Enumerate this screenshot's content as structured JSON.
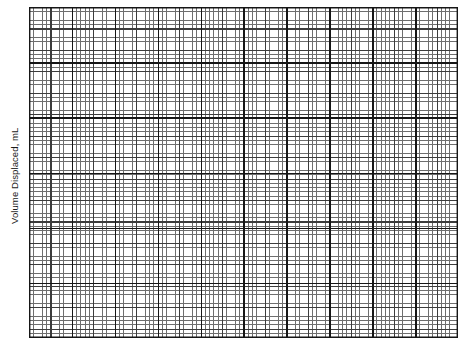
{
  "figure": {
    "type": "graph-paper",
    "background_color": "#ffffff"
  },
  "axes": {
    "y_label": "Volume Displaced, mL",
    "x_label": "",
    "y_label_rotation_deg": -90
  },
  "chart_data": {
    "type": "table",
    "title": "",
    "subtitle": "",
    "xlabel": "",
    "ylabel": "Volume Displaced, mL",
    "categories": [],
    "values": [],
    "series": [],
    "annotations": [],
    "legend": [],
    "legend_position": "none",
    "grid": true,
    "grid_detail": {
      "fine_cell_px": 4.29,
      "minor_lines_per_major": 5,
      "major_cell_px": 21.45,
      "section_cell_width_px": 42.9,
      "section_cell_height_px": 55.2,
      "fine_line_color": "#6e6e6e",
      "major_line_color": "#3c3c3c",
      "section_line_color": "#161616",
      "plot_left_px": 29,
      "plot_top_px": 7,
      "plot_width_px": 429,
      "plot_height_px": 331
    }
  }
}
